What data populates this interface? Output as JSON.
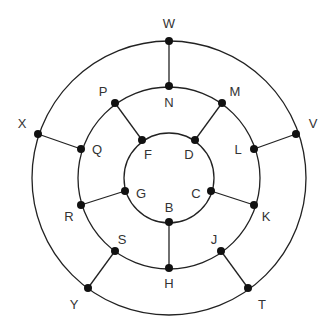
{
  "diagram": {
    "type": "concentric-ring-graph",
    "center": [
      169,
      178
    ],
    "rings": [
      {
        "name": "outer",
        "r": 137
      },
      {
        "name": "middle",
        "r": 91
      },
      {
        "name": "inner",
        "r": 45
      }
    ],
    "nodes": [
      {
        "id": "W",
        "x": 169,
        "y": 41,
        "lx": 169,
        "ly": 23
      },
      {
        "id": "N",
        "x": 169,
        "y": 86,
        "lx": 169,
        "ly": 102
      },
      {
        "id": "M",
        "x": 222,
        "y": 103,
        "lx": 235,
        "ly": 91
      },
      {
        "id": "P",
        "x": 115,
        "y": 103,
        "lx": 103,
        "ly": 91
      },
      {
        "id": "F",
        "x": 142,
        "y": 140,
        "lx": 148,
        "ly": 154
      },
      {
        "id": "D",
        "x": 195,
        "y": 140,
        "lx": 189,
        "ly": 154
      },
      {
        "id": "X",
        "x": 38,
        "y": 134,
        "lx": 22,
        "ly": 123
      },
      {
        "id": "Q",
        "x": 81,
        "y": 149,
        "lx": 97,
        "ly": 149
      },
      {
        "id": "V",
        "x": 296,
        "y": 134,
        "lx": 313,
        "ly": 123
      },
      {
        "id": "L",
        "x": 254,
        "y": 149,
        "lx": 238,
        "ly": 149
      },
      {
        "id": "G",
        "x": 125,
        "y": 191,
        "lx": 141,
        "ly": 193
      },
      {
        "id": "C",
        "x": 211,
        "y": 191,
        "lx": 196,
        "ly": 193
      },
      {
        "id": "R",
        "x": 81,
        "y": 205,
        "lx": 69,
        "ly": 216
      },
      {
        "id": "K",
        "x": 254,
        "y": 205,
        "lx": 266,
        "ly": 216
      },
      {
        "id": "B",
        "x": 169,
        "y": 222,
        "lx": 169,
        "ly": 207
      },
      {
        "id": "S",
        "x": 115,
        "y": 251,
        "lx": 122,
        "ly": 239
      },
      {
        "id": "J",
        "x": 221,
        "y": 251,
        "lx": 214,
        "ly": 239
      },
      {
        "id": "H",
        "x": 169,
        "y": 268,
        "lx": 169,
        "ly": 283
      },
      {
        "id": "Y",
        "x": 88,
        "y": 288,
        "lx": 74,
        "ly": 304
      },
      {
        "id": "T",
        "x": 248,
        "y": 288,
        "lx": 262,
        "ly": 304
      }
    ],
    "edges": [
      [
        "W",
        "N"
      ],
      [
        "M",
        "D"
      ],
      [
        "P",
        "F"
      ],
      [
        "X",
        "Q"
      ],
      [
        "V",
        "L"
      ],
      [
        "G",
        "R"
      ],
      [
        "C",
        "K"
      ],
      [
        "B",
        "H"
      ],
      [
        "S",
        "Y"
      ],
      [
        "J",
        "T"
      ]
    ],
    "colors": {
      "line": "#222222",
      "node": "#111111",
      "label": "#333333",
      "background": "#ffffff"
    }
  }
}
